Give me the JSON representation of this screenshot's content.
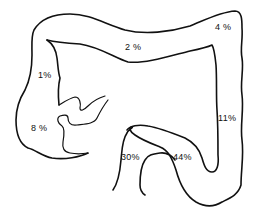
{
  "diagram": {
    "stroke_color": "#111111",
    "background_color": "#ffffff",
    "labels": [
      {
        "id": "transverse",
        "text": "2 %",
        "x": 125,
        "y": 43
      },
      {
        "id": "splenic-flexure",
        "text": "4 %",
        "x": 215,
        "y": 23
      },
      {
        "id": "ascending",
        "text": "1%",
        "x": 38,
        "y": 71
      },
      {
        "id": "cecum",
        "text": "8 %",
        "x": 31,
        "y": 124
      },
      {
        "id": "descending",
        "text": "11%",
        "x": 218,
        "y": 114
      },
      {
        "id": "sigmoid",
        "text": "44%",
        "x": 173,
        "y": 153
      },
      {
        "id": "rectum",
        "text": "30%",
        "x": 121,
        "y": 153
      }
    ]
  }
}
